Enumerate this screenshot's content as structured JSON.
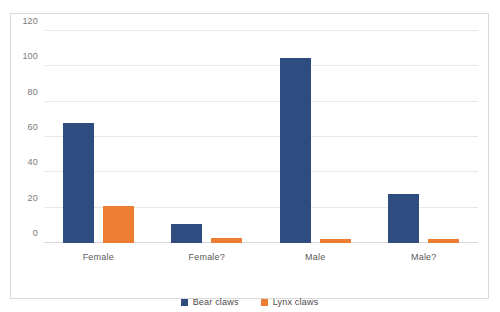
{
  "chart_data": {
    "type": "bar",
    "title": "",
    "xlabel": "",
    "ylabel": "",
    "categories": [
      "Female",
      "Female?",
      "Male",
      "Male?"
    ],
    "series": [
      {
        "name": "Bear claws",
        "color": "#2E4C80",
        "values": [
          68,
          11,
          105,
          28
        ]
      },
      {
        "name": "Lynx claws",
        "color": "#ED7D31",
        "values": [
          21,
          3,
          2,
          2
        ]
      }
    ],
    "ylim": [
      0,
      120
    ],
    "yticks": [
      0,
      20,
      40,
      60,
      80,
      100,
      120
    ],
    "ytick_labels": [
      "0",
      "20",
      "40",
      "60",
      "80",
      "100",
      "120"
    ],
    "grid": true,
    "legend_position": "bottom"
  }
}
